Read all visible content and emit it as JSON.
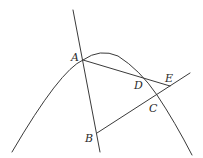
{
  "figure": {
    "type": "geometry",
    "points": {
      "A": {
        "label": "A",
        "x": 83,
        "y": 60
      },
      "B": {
        "label": "B",
        "x": 97,
        "y": 133
      },
      "C": {
        "label": "C",
        "x": 157,
        "y": 95
      },
      "D": {
        "label": "D",
        "x": 144,
        "y": 79
      },
      "E": {
        "label": "E",
        "x": 170,
        "y": 86
      }
    },
    "labels": {
      "A": "A",
      "B": "B",
      "C": "C",
      "D": "D",
      "E": "E"
    },
    "curves": [
      {
        "name": "parabola",
        "kind": "curve",
        "through": [
          "A",
          "D",
          "C"
        ]
      }
    ],
    "lines": [
      {
        "name": "line-AB",
        "through": [
          "A",
          "B"
        ],
        "extended": true
      },
      {
        "name": "segment-AE",
        "through": [
          "A",
          "D",
          "E"
        ]
      },
      {
        "name": "line-BC",
        "through": [
          "B",
          "C",
          "E"
        ],
        "extended": true
      }
    ],
    "stroke_color": "#3a3a3a",
    "background_color": "#ffffff"
  }
}
